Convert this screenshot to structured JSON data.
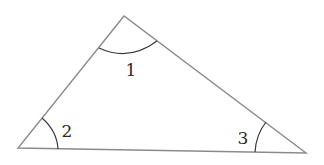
{
  "diagram": {
    "type": "triangle",
    "stroke_color": "#8a8a8a",
    "arc_color": "#3a3a3a",
    "vertices": {
      "top": [
        124,
        16
      ],
      "bottom_left": [
        18,
        148
      ],
      "bottom_right": [
        306,
        153
      ]
    },
    "angles": [
      {
        "label": "1",
        "vertex": "top",
        "arc": "M99,48 Q129,62 157,41",
        "label_pos": [
          131,
          76
        ]
      },
      {
        "label": "2",
        "vertex": "bottom_left",
        "arc": "M42,118 Q57,131 58,149",
        "label_pos": [
          66,
          137
        ]
      },
      {
        "label": "3",
        "vertex": "bottom_right",
        "arc": "M266,122 Q256,135 255,152",
        "label_pos": [
          243,
          144
        ]
      }
    ]
  }
}
